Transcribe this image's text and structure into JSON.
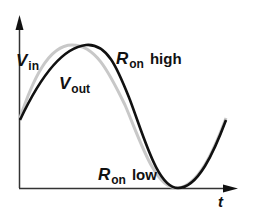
{
  "diagram": {
    "axes": {
      "x_label": "t"
    },
    "curves": [
      {
        "name": "V_in",
        "color": "#c8c8c8",
        "description": "input sinusoid (gray)"
      },
      {
        "name": "V_out",
        "color": "#111111",
        "description": "output waveform (black), lagging and distorted near peak"
      }
    ],
    "labels": {
      "vin": {
        "main": "V",
        "sub": "in"
      },
      "vout": {
        "main": "V",
        "sub": "out"
      },
      "ron_high": {
        "main": "R",
        "sub": "on",
        "word": "high"
      },
      "ron_low": {
        "main": "R",
        "sub": "on",
        "word": "low"
      }
    }
  }
}
